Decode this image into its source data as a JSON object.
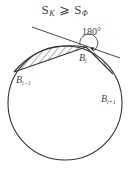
{
  "title": {
    "s1_main": "S",
    "s1_sub": "K",
    "relation": "⩾",
    "s2_main": "S",
    "s2_sub": "Φ"
  },
  "figure": {
    "circle": {
      "cx": 65,
      "cy": 103,
      "r": 57
    },
    "points": [
      {
        "id": "B_i-1",
        "label_main": "B",
        "label_sub": "i−1",
        "x": 14,
        "y": 72
      },
      {
        "id": "B_i",
        "label_main": "B",
        "label_sub": "i",
        "x": 86,
        "y": 48
      },
      {
        "id": "B_i+1",
        "label_main": "B",
        "label_sub": "i+1",
        "x": 113,
        "y": 74
      }
    ],
    "angle_label": "180°",
    "colors": {
      "stroke": "#333333",
      "hatch": "#444444",
      "text": "#444444"
    }
  }
}
